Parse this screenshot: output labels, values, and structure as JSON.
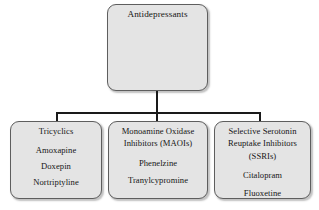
{
  "diagram": {
    "type": "hierarchy-tree",
    "colors": {
      "node_fill": "#e4e4e4",
      "node_border": "#5e5e5e",
      "connector": "#1a1a1a",
      "page_background": "#ffffff",
      "text": "#161616"
    },
    "root": {
      "label": "Antidepressants"
    },
    "branches": [
      {
        "heading": "Tricyclics",
        "items": [
          "Amoxapine",
          "Doxepin",
          "Nortriptyline"
        ]
      },
      {
        "heading": "Monoamine Oxidase Inhibitors (MAOIs)",
        "heading_lines": [
          "Monoamine Oxidase",
          "Inhibitors (MAOIs)"
        ],
        "items": [
          "Phenelzine",
          "Tranylcypromine"
        ]
      },
      {
        "heading": "Selective Serotonin Reuptake Inhibitors (SSRIs)",
        "heading_lines": [
          "Selective Serotonin",
          "Reuptake Inhibitors",
          "(SSRIs)"
        ],
        "items": [
          "Citalopram",
          "Fluoxetine"
        ]
      }
    ]
  }
}
